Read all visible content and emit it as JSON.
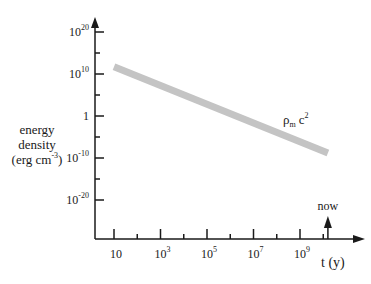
{
  "chart_data": {
    "type": "line",
    "title": "",
    "xlabel": "t (y)",
    "ylabel": [
      "energy",
      "density",
      "(erg cm^-3)"
    ],
    "x_scale": "log",
    "y_scale": "log",
    "x_ticks": [
      {
        "base": "10",
        "exp": "",
        "log": 1
      },
      {
        "base": "10",
        "exp": "3",
        "log": 3
      },
      {
        "base": "10",
        "exp": "5",
        "log": 5
      },
      {
        "base": "10",
        "exp": "7",
        "log": 7
      },
      {
        "base": "10",
        "exp": "9",
        "log": 9
      }
    ],
    "y_ticks": [
      {
        "base": "10",
        "exp": "20",
        "log": 20
      },
      {
        "base": "10",
        "exp": "10",
        "log": 10
      },
      {
        "base": "1",
        "exp": "",
        "log": 0
      },
      {
        "base": "10",
        "exp": "-10",
        "log": -10
      },
      {
        "base": "10",
        "exp": "-20",
        "log": -20
      }
    ],
    "xlim_log": [
      0.2,
      11.5
    ],
    "ylim_log": [
      -29,
      23
    ],
    "series": [
      {
        "name": "ρm c²",
        "label_main": "ρ",
        "label_sub": "m",
        "label_c": "c",
        "label_sup": "2",
        "color": "#c4c4c4",
        "x_log": [
          1.0,
          10.2
        ],
        "y_log": [
          11.7,
          -8.8
        ]
      }
    ],
    "annotations": [
      {
        "text": "now",
        "x_log": 10.2,
        "type": "arrow-up"
      }
    ],
    "grid": false,
    "legend": "none"
  }
}
